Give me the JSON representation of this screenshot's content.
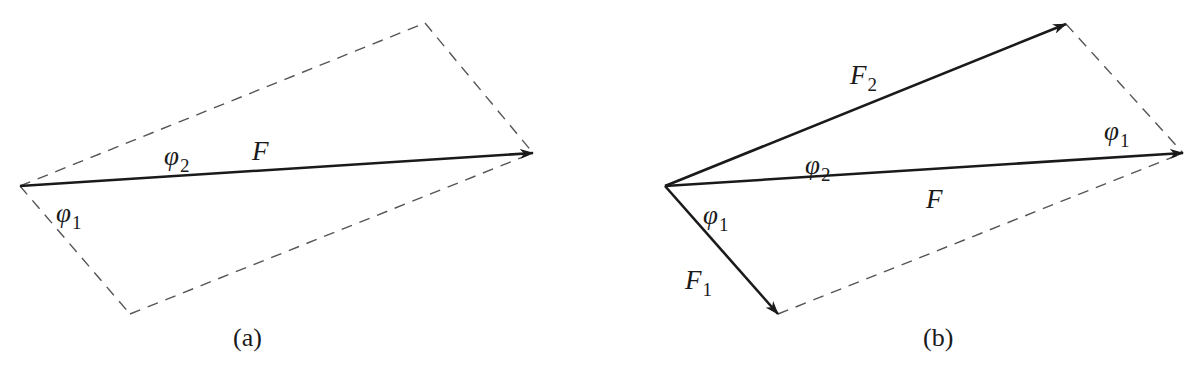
{
  "figure": {
    "panels": [
      {
        "id": "a",
        "caption": "(a)",
        "labels": {
          "phi2": {
            "symbol": "φ",
            "sub": "2"
          },
          "F": {
            "symbol": "F"
          },
          "phi1": {
            "symbol": "φ",
            "sub": "1"
          }
        },
        "vectors": [
          {
            "name": "F",
            "from": [
              20,
              186
            ],
            "to": [
              533,
              153
            ],
            "style": "solid-arrow"
          }
        ],
        "dashed_edges": [
          {
            "from": [
              20,
              186
            ],
            "to": [
              425,
              23
            ]
          },
          {
            "from": [
              425,
              23
            ],
            "to": [
              533,
              153
            ]
          },
          {
            "from": [
              20,
              186
            ],
            "to": [
              130,
              314
            ]
          },
          {
            "from": [
              130,
              314
            ],
            "to": [
              533,
              153
            ]
          }
        ]
      },
      {
        "id": "b",
        "caption": "(b)",
        "labels": {
          "F2": {
            "symbol": "F",
            "sub": "2"
          },
          "phi1_right": {
            "symbol": "φ",
            "sub": "1"
          },
          "phi2": {
            "symbol": "φ",
            "sub": "2"
          },
          "F": {
            "symbol": "F"
          },
          "phi1_left": {
            "symbol": "φ",
            "sub": "1"
          },
          "F1": {
            "symbol": "F",
            "sub": "1"
          }
        },
        "vectors": [
          {
            "name": "F2",
            "from": [
              665,
              186
            ],
            "to": [
              1066,
              24
            ],
            "style": "solid-arrow"
          },
          {
            "name": "F",
            "from": [
              665,
              186
            ],
            "to": [
              1183,
              153
            ],
            "style": "solid-arrow"
          },
          {
            "name": "F1",
            "from": [
              665,
              186
            ],
            "to": [
              778,
              314
            ],
            "style": "solid-arrow"
          }
        ],
        "dashed_edges": [
          {
            "from": [
              1066,
              24
            ],
            "to": [
              1183,
              153
            ]
          },
          {
            "from": [
              778,
              314
            ],
            "to": [
              1183,
              153
            ]
          }
        ]
      }
    ],
    "colors": {
      "ink": "#1a1a1a",
      "dash": "#555555",
      "background": "#ffffff"
    }
  }
}
